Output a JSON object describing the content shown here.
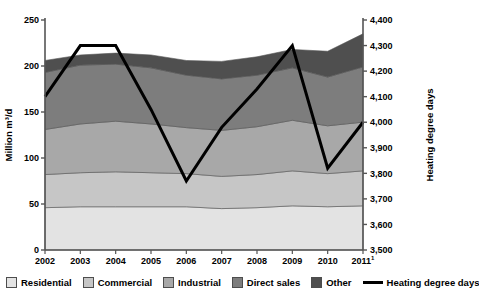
{
  "chart_data": {
    "type": "area",
    "title": "",
    "subtitle": "",
    "xlabel": "",
    "ylabel": "Million m³/d",
    "y2label": "Heating degree days",
    "categories": [
      "2002",
      "2003",
      "2004",
      "2005",
      "2006",
      "2007",
      "2008",
      "2009",
      "2010",
      "2011¹"
    ],
    "x_tick_labels": [
      "2002",
      "2003",
      "2004",
      "2005",
      "2006",
      "2007",
      "2008",
      "2009",
      "2010",
      "2011"
    ],
    "x_last_label_superscript": "1",
    "ylim": [
      0,
      250
    ],
    "y_ticks": [
      0,
      50,
      100,
      150,
      200,
      250
    ],
    "y_tick_labels": [
      "0",
      "50",
      "100",
      "150",
      "200",
      "250"
    ],
    "y2lim": [
      3500,
      4400
    ],
    "y2_ticks": [
      3500,
      3600,
      3700,
      3800,
      3900,
      4000,
      4100,
      4200,
      4300,
      4400
    ],
    "y2_tick_labels": [
      "3,500",
      "3,600",
      "3,700",
      "3,800",
      "3,900",
      "4,000",
      "4,100",
      "4,200",
      "4,300",
      "4,400"
    ],
    "grid": false,
    "stacked": true,
    "legend_position": "bottom",
    "series": [
      {
        "name": "Residential",
        "color": "#e3e3e3",
        "values": [
          46,
          47,
          47,
          47,
          47,
          45,
          46,
          48,
          47,
          48
        ]
      },
      {
        "name": "Commercial",
        "color": "#c6c6c6",
        "values": [
          36,
          37,
          38,
          37,
          36,
          35,
          36,
          38,
          36,
          38
        ]
      },
      {
        "name": "Industrial",
        "color": "#a8a8a8",
        "values": [
          49,
          53,
          55,
          53,
          50,
          50,
          52,
          55,
          52,
          53
        ]
      },
      {
        "name": "Direct sales",
        "color": "#7d7d7d",
        "values": [
          62,
          64,
          62,
          61,
          57,
          56,
          56,
          57,
          53,
          60
        ]
      },
      {
        "name": "Other",
        "color": "#4f4f4f",
        "values": [
          13,
          11,
          12,
          14,
          16,
          19,
          20,
          20,
          28,
          36
        ]
      }
    ],
    "stack_totals": [
      206,
      212,
      214,
      212,
      206,
      205,
      210,
      218,
      216,
      235
    ],
    "line_series": {
      "name": "Heating degree days",
      "color": "#000000",
      "axis": "right",
      "values": [
        4100,
        4300,
        4300,
        4050,
        3770,
        3980,
        4130,
        4300,
        3820,
        4000
      ]
    }
  },
  "legend": {
    "items": [
      {
        "label": "Residential",
        "swatch": "#e3e3e3",
        "kind": "swatch"
      },
      {
        "label": "Commercial",
        "swatch": "#c6c6c6",
        "kind": "swatch"
      },
      {
        "label": "Industrial",
        "swatch": "#a8a8a8",
        "kind": "swatch"
      },
      {
        "label": "Direct sales",
        "swatch": "#7d7d7d",
        "kind": "swatch"
      },
      {
        "label": "Other",
        "swatch": "#4f4f4f",
        "kind": "swatch"
      },
      {
        "label": "Heating degree days",
        "swatch": "#000000",
        "kind": "line"
      }
    ]
  },
  "axes": {
    "left_title": "Million m³/d",
    "right_title": "Heating degree days"
  }
}
